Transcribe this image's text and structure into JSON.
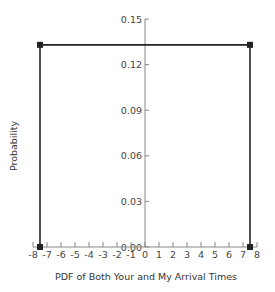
{
  "chart_data": {
    "type": "line",
    "title": "",
    "xlabel": "PDF of Both Your and My Arrival Times",
    "ylabel": "Probability",
    "x": [
      -7.5,
      -7.5,
      7.5,
      7.5
    ],
    "y": [
      0.0,
      0.133,
      0.133,
      0.0
    ],
    "series": [
      {
        "name": "PDF",
        "x": [
          -7.5,
          -7.5,
          7.5,
          7.5
        ],
        "values": [
          0.0,
          0.133,
          0.133,
          0.0
        ],
        "color": "#222222",
        "marker": "square"
      }
    ],
    "xlim": [
      -8,
      8
    ],
    "ylim": [
      0,
      0.15
    ],
    "x_ticks": [
      "-8",
      "-7",
      "-6",
      "-5",
      "-4",
      "-3",
      "-2",
      "-1",
      "0",
      "1",
      "2",
      "3",
      "4",
      "5",
      "6",
      "7",
      "8"
    ],
    "y_ticks": [
      "0.00",
      "0.03",
      "0.06",
      "0.09",
      "0.12",
      "0.15"
    ],
    "grid": false,
    "legend": null
  },
  "labels": {
    "xlabel": "PDF of Both Your and My Arrival Times",
    "ylabel": "Probability"
  },
  "colors": {
    "line": "#222222",
    "axis": "#888888",
    "text": "#444444"
  }
}
